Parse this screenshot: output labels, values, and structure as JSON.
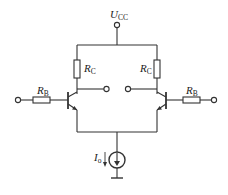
{
  "diagram": {
    "type": "differential-amplifier-schematic",
    "supply": {
      "label": "U",
      "subscript": "CC"
    },
    "collector_resistors": [
      {
        "side": "left",
        "label": "R",
        "subscript": "C"
      },
      {
        "side": "right",
        "label": "R",
        "subscript": "C"
      }
    ],
    "base_resistors": [
      {
        "side": "left",
        "label": "R",
        "subscript": "B"
      },
      {
        "side": "right",
        "label": "R",
        "subscript": "B"
      }
    ],
    "current_source": {
      "label": "I",
      "subscript": "o"
    },
    "transistors": [
      {
        "side": "left",
        "type": "NPN"
      },
      {
        "side": "right",
        "type": "NPN"
      }
    ],
    "colors": {
      "wire": "#333333",
      "background": "#ffffff"
    }
  }
}
